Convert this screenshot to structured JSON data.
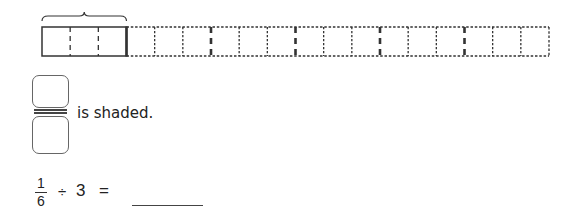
{
  "model": {
    "total_cells": 18,
    "groups": 6,
    "cells_per_group": 3,
    "highlighted_groups": 1,
    "stroke_color": "#333333"
  },
  "fraction_answer": {
    "numerator_value": "",
    "denominator_value": "",
    "suffix_text": "is shaded."
  },
  "equation": {
    "fraction_numerator": "1",
    "fraction_denominator": "6",
    "operator": "÷",
    "divisor": "3",
    "equals": "=",
    "answer_value": ""
  }
}
